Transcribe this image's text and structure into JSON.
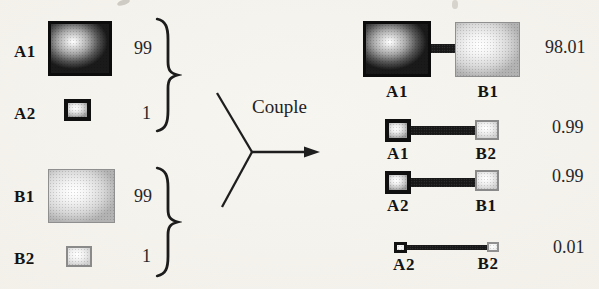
{
  "left": {
    "groups": [
      {
        "name": "A-components",
        "items": [
          {
            "label": "A1",
            "value": "99"
          },
          {
            "label": "A2",
            "value": "1"
          }
        ]
      },
      {
        "name": "B-components",
        "items": [
          {
            "label": "B1",
            "value": "99"
          },
          {
            "label": "B2",
            "value": "1"
          }
        ]
      }
    ]
  },
  "process": {
    "label": "Couple"
  },
  "right": {
    "pairs": [
      {
        "left": "A1",
        "right": "B1",
        "value": "98.01"
      },
      {
        "left": "A1",
        "right": "B2",
        "value": "0.99"
      },
      {
        "left": "A2",
        "right": "B1",
        "value": "0.99"
      },
      {
        "left": "A2",
        "right": "B2",
        "value": "0.01"
      }
    ]
  },
  "colors": {
    "paper": "#f4f2ec",
    "ink": "#1a1a1a",
    "dark_square_edge": "#161616",
    "light_square_edge": "#b2b2b2"
  }
}
